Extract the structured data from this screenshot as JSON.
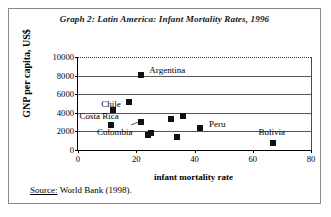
{
  "figure": {
    "title": "Graph 2: Latin America: Infant Mortality Rates, 1996",
    "source_label": "Source:",
    "source_text": "World Bank (1998)."
  },
  "chart_data": {
    "type": "scatter",
    "title": "Graph 2: Latin America: Infant Mortality Rates, 1996",
    "xlabel": "infant mortality rate",
    "ylabel": "GNP per capita, US$",
    "xlim": [
      0,
      80
    ],
    "ylim": [
      0,
      10000
    ],
    "xticks": [
      0,
      20,
      40,
      60,
      80
    ],
    "yticks": [
      0,
      2000,
      4000,
      6000,
      8000,
      10000
    ],
    "xtick_labels": [
      "0",
      "20",
      "40",
      "60",
      "80"
    ],
    "ytick_labels": [
      "0",
      "2000",
      "4000",
      "6000",
      "8000",
      "10000"
    ],
    "grid": "horizontal",
    "legend": "none",
    "marker": "filled-square",
    "marker_color": "#111111",
    "points": [
      {
        "label": "Argentina",
        "x": 21.5,
        "y": 8050,
        "label_position": "right"
      },
      {
        "label": "",
        "x": 17.5,
        "y": 5200,
        "label_position": "none"
      },
      {
        "label": "Chile",
        "x": 12.0,
        "y": 4350,
        "label_position": "left"
      },
      {
        "label": "Costa Rica",
        "x": 11.5,
        "y": 2650,
        "label_position": "left"
      },
      {
        "label": "Colombia",
        "x": 21.5,
        "y": 3050,
        "label_position": "leader-below-left"
      },
      {
        "label": "",
        "x": 24.0,
        "y": 1600,
        "label_position": "none"
      },
      {
        "label": "",
        "x": 25.2,
        "y": 1850,
        "label_position": "none"
      },
      {
        "label": "",
        "x": 32.0,
        "y": 3350,
        "label_position": "none"
      },
      {
        "label": "",
        "x": 36.0,
        "y": 3650,
        "label_position": "none"
      },
      {
        "label": "",
        "x": 34.0,
        "y": 1400,
        "label_position": "none"
      },
      {
        "label": "Peru",
        "x": 42.0,
        "y": 2350,
        "label_position": "right"
      },
      {
        "label": "Bolivia",
        "x": 67.0,
        "y": 800,
        "label_position": "above"
      }
    ],
    "annotations": [
      {
        "text": "Argentina",
        "x": 24.5,
        "y": 8600
      },
      {
        "text": "Chile",
        "x": 8.0,
        "y": 4900
      },
      {
        "text": "Costa Rica",
        "x": 0.5,
        "y": 3700
      },
      {
        "text": "Colombia",
        "x": 6.5,
        "y": 1900
      },
      {
        "text": "Peru",
        "x": 45.0,
        "y": 2800
      },
      {
        "text": "Bolivia",
        "x": 62.0,
        "y": 1900
      }
    ]
  },
  "colors": {
    "marker": "#111111",
    "grid": "#555555",
    "axis": "#000000",
    "frame": "#8a8a8a",
    "background": "#ffffff"
  }
}
